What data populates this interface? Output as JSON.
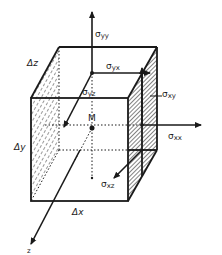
{
  "figure": {
    "type": "stress-element-cube",
    "labels": {
      "sigma_yy": {
        "symbol": "σ",
        "sub": "yy"
      },
      "sigma_yx": {
        "symbol": "σ",
        "sub": "yx"
      },
      "sigma_yz": {
        "symbol": "σ",
        "sub": "yz"
      },
      "sigma_xy": {
        "symbol": "σ",
        "sub": "xy"
      },
      "sigma_xx": {
        "symbol": "σ",
        "sub": "xx"
      },
      "sigma_xz": {
        "symbol": "σ",
        "sub": "xz"
      },
      "point_M": "M",
      "delta_x": "Δx",
      "delta_y": "Δy",
      "delta_z": "Δz",
      "axis_z": "z"
    },
    "colors": {
      "ink": "#1a1a1a",
      "background": "#ffffff"
    }
  }
}
